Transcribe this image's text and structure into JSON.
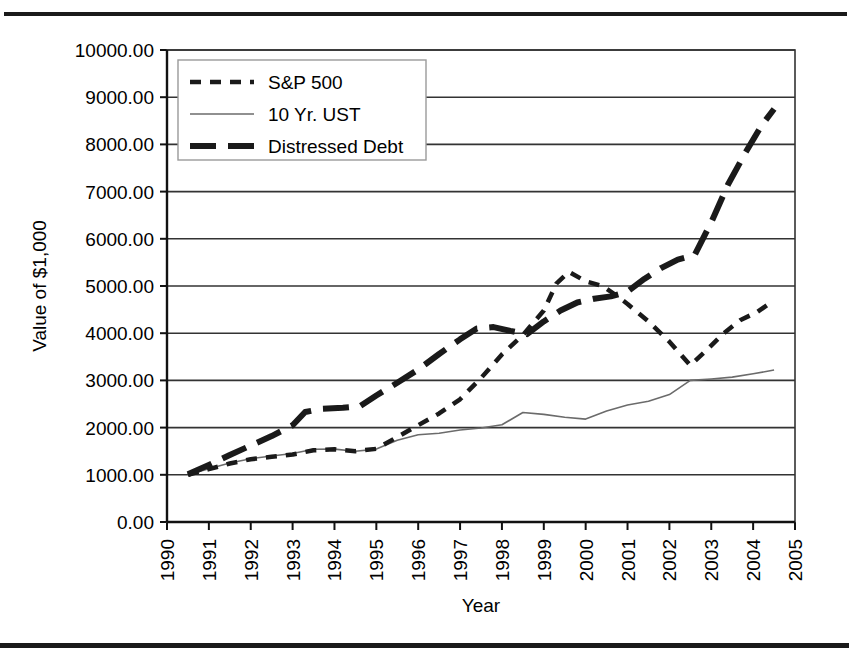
{
  "figure": {
    "has_top_rule": true,
    "has_bottom_rule": true,
    "rule_color": "#1a1a1a",
    "background": "#ffffff"
  },
  "chart_data": {
    "type": "line",
    "title": "",
    "subtitle": "",
    "xlabel": "Year",
    "ylabel": "Value of $1,000",
    "xlim": [
      1990,
      2005
    ],
    "ylim": [
      0,
      10000
    ],
    "grid": "horizontal",
    "legend_position": "upper-left",
    "x_tick_labels": [
      "1990",
      "1991",
      "1992",
      "1993",
      "1994",
      "1995",
      "1996",
      "1997",
      "1998",
      "1999",
      "2000",
      "2001",
      "2002",
      "2003",
      "2004",
      "2005"
    ],
    "x_tick_values": [
      1990,
      1991,
      1992,
      1993,
      1994,
      1995,
      1996,
      1997,
      1998,
      1999,
      2000,
      2001,
      2002,
      2003,
      2004,
      2005
    ],
    "x_tick_rotation": -90,
    "y_tick_labels": [
      "0.00",
      "1000.00",
      "2000.00",
      "3000.00",
      "4000.00",
      "5000.00",
      "6000.00",
      "7000.00",
      "8000.00",
      "9000.00",
      "10000.00"
    ],
    "y_tick_values": [
      0,
      1000,
      2000,
      3000,
      4000,
      5000,
      6000,
      7000,
      8000,
      9000,
      10000
    ],
    "series": [
      {
        "name": "S&P 500",
        "style": "short-dashed",
        "color": "#1a1a1a",
        "width": 4.5,
        "dasharray": "11,9",
        "points": [
          [
            1990.5,
            1000
          ],
          [
            1991.0,
            1120
          ],
          [
            1991.5,
            1240
          ],
          [
            1992.0,
            1330
          ],
          [
            1992.5,
            1380
          ],
          [
            1993.0,
            1430
          ],
          [
            1993.5,
            1520
          ],
          [
            1994.0,
            1540
          ],
          [
            1994.5,
            1500
          ],
          [
            1995.0,
            1550
          ],
          [
            1995.5,
            1800
          ],
          [
            1996.0,
            2050
          ],
          [
            1996.5,
            2300
          ],
          [
            1997.0,
            2600
          ],
          [
            1997.5,
            3050
          ],
          [
            1998.0,
            3550
          ],
          [
            1998.5,
            3960
          ],
          [
            1999.0,
            4480
          ],
          [
            1999.3,
            5050
          ],
          [
            1999.6,
            5300
          ],
          [
            2000.0,
            5100
          ],
          [
            2000.4,
            5000
          ],
          [
            2000.7,
            4820
          ],
          [
            2001.0,
            4620
          ],
          [
            2001.5,
            4250
          ],
          [
            2002.0,
            3820
          ],
          [
            2002.5,
            3320
          ],
          [
            2002.9,
            3650
          ],
          [
            2003.3,
            4000
          ],
          [
            2003.7,
            4280
          ],
          [
            2004.1,
            4450
          ],
          [
            2004.5,
            4700
          ]
        ]
      },
      {
        "name": "10 Yr. UST",
        "style": "thin-solid",
        "color": "#6b6b6b",
        "width": 1.6,
        "dasharray": "",
        "points": [
          [
            1990.5,
            1000
          ],
          [
            1991.0,
            1130
          ],
          [
            1991.5,
            1250
          ],
          [
            1992.0,
            1340
          ],
          [
            1992.5,
            1400
          ],
          [
            1993.0,
            1450
          ],
          [
            1993.5,
            1540
          ],
          [
            1994.0,
            1545
          ],
          [
            1994.5,
            1500
          ],
          [
            1995.0,
            1545
          ],
          [
            1995.5,
            1730
          ],
          [
            1996.0,
            1850
          ],
          [
            1996.5,
            1880
          ],
          [
            1997.0,
            1950
          ],
          [
            1997.5,
            1990
          ],
          [
            1998.0,
            2060
          ],
          [
            1998.5,
            2320
          ],
          [
            1999.0,
            2280
          ],
          [
            1999.5,
            2220
          ],
          [
            2000.0,
            2180
          ],
          [
            2000.5,
            2350
          ],
          [
            2001.0,
            2480
          ],
          [
            2001.5,
            2560
          ],
          [
            2002.0,
            2700
          ],
          [
            2002.5,
            3000
          ],
          [
            2003.0,
            3030
          ],
          [
            2003.5,
            3070
          ],
          [
            2004.0,
            3140
          ],
          [
            2004.5,
            3220
          ]
        ]
      },
      {
        "name": "Distressed Debt",
        "style": "long-dashed",
        "color": "#1a1a1a",
        "width": 6.0,
        "dasharray": "26,12",
        "points": [
          [
            1990.5,
            1010
          ],
          [
            1991.0,
            1210
          ],
          [
            1991.5,
            1420
          ],
          [
            1992.0,
            1620
          ],
          [
            1992.5,
            1820
          ],
          [
            1993.0,
            2050
          ],
          [
            1993.3,
            2330
          ],
          [
            1993.7,
            2400
          ],
          [
            1994.2,
            2420
          ],
          [
            1994.6,
            2450
          ],
          [
            1995.0,
            2680
          ],
          [
            1995.5,
            2950
          ],
          [
            1996.0,
            3230
          ],
          [
            1996.5,
            3560
          ],
          [
            1997.0,
            3870
          ],
          [
            1997.4,
            4100
          ],
          [
            1997.8,
            4130
          ],
          [
            1998.2,
            4050
          ],
          [
            1998.6,
            3980
          ],
          [
            1999.0,
            4250
          ],
          [
            1999.4,
            4480
          ],
          [
            1999.8,
            4650
          ],
          [
            2000.2,
            4730
          ],
          [
            2000.6,
            4780
          ],
          [
            2001.0,
            4880
          ],
          [
            2001.4,
            5150
          ],
          [
            2001.8,
            5380
          ],
          [
            2002.2,
            5560
          ],
          [
            2002.6,
            5650
          ],
          [
            2003.0,
            6350
          ],
          [
            2003.4,
            7150
          ],
          [
            2003.8,
            7800
          ],
          [
            2004.2,
            8400
          ],
          [
            2004.5,
            8750
          ]
        ]
      }
    ]
  },
  "legend": {
    "entries": [
      {
        "label": "S&P 500"
      },
      {
        "label": "10 Yr. UST"
      },
      {
        "label": "Distressed Debt"
      }
    ]
  }
}
